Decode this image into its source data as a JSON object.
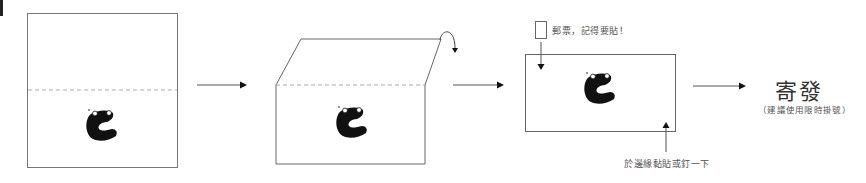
{
  "diagram": {
    "steps": [
      {
        "id": "step-1",
        "description": "Flat sheet with dashed fold line"
      },
      {
        "id": "step-2",
        "description": "Sheet folded along dashed line, corner folding back"
      },
      {
        "id": "step-3",
        "description": "Folded envelope with stamp"
      },
      {
        "id": "step-4",
        "description": "Send"
      }
    ],
    "stamp_label": "郵票，記得要貼！",
    "seal_label": "於邊緣黏貼或釘一下",
    "send_title": "寄發",
    "send_note": "（建議使用限時掛號）"
  },
  "colors": {
    "line": "#555555",
    "dashed": "#aaaaaa",
    "mascot": "#111111",
    "text": "#333333"
  }
}
